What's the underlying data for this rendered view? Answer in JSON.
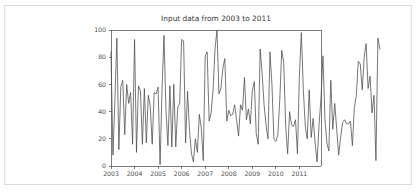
{
  "card": {
    "background_color": "#ffffff",
    "border_color": "#d9dcdf"
  },
  "chart_data": {
    "type": "line",
    "title": "Input data from 2003 to 2011",
    "xlabel": "",
    "ylabel": "",
    "xlim": [
      2003.0,
      2011.9166666667
    ],
    "ylim": [
      0,
      100
    ],
    "grid": false,
    "legend": null,
    "line_color": "#4a4a4a",
    "axis_color": "#5a5a5a",
    "x_tick_labels": [
      "2003",
      "2004",
      "2005",
      "2006",
      "2007",
      "2008",
      "2009",
      "2010",
      "2011"
    ],
    "x_tick_values": [
      2003,
      2004,
      2005,
      2006,
      2007,
      2008,
      2009,
      2010,
      2011
    ],
    "y_tick_labels": [
      "0",
      "20",
      "40",
      "60",
      "80",
      "100"
    ],
    "y_tick_values": [
      0,
      20,
      40,
      60,
      80,
      100
    ],
    "x_start": 2003.0,
    "x_step": 0.0833333333,
    "series": [
      {
        "name": "input data",
        "values": [
          84,
          8,
          49,
          94,
          12,
          58,
          63,
          23,
          60,
          46,
          54,
          16,
          93,
          10,
          59,
          55,
          16,
          57,
          17,
          52,
          44,
          16,
          54,
          53,
          58,
          1,
          56,
          96,
          42,
          15,
          59,
          14,
          60,
          14,
          43,
          46,
          93,
          92,
          17,
          55,
          26,
          9,
          3,
          20,
          10,
          38,
          28,
          4,
          81,
          84,
          33,
          39,
          56,
          86,
          100,
          53,
          57,
          72,
          79,
          33,
          41,
          37,
          38,
          45,
          34,
          22,
          45,
          41,
          65,
          34,
          42,
          31,
          55,
          62,
          24,
          16,
          86,
          68,
          45,
          30,
          20,
          84,
          60,
          20,
          18,
          23,
          49,
          85,
          76,
          30,
          9,
          40,
          30,
          29,
          34,
          9,
          67,
          98,
          56,
          29,
          20,
          56,
          21,
          35,
          17,
          3,
          30,
          50,
          81,
          35,
          17,
          11,
          63,
          27,
          46,
          27,
          8,
          21,
          32,
          34,
          31,
          31,
          33,
          15,
          43,
          52,
          77,
          75,
          56,
          80,
          90,
          57,
          66,
          39,
          52,
          4,
          94,
          86
        ]
      }
    ]
  },
  "plot_geometry": {
    "left": 106,
    "top": 24,
    "right": 316,
    "bottom": 160
  }
}
